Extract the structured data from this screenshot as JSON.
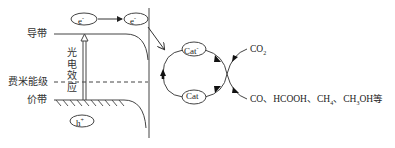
{
  "diagram": {
    "band_labels": {
      "conduction_band": "导带",
      "fermi_level": "费米能级",
      "valence_band": "价带"
    },
    "photoelectric_effect_label": [
      "光",
      "电",
      "效",
      "应"
    ],
    "carriers": {
      "electron": {
        "base": "e",
        "sup": "-"
      },
      "electron_interface": {
        "base": "e",
        "sup": "-"
      },
      "hole": {
        "base": "h",
        "sup": "+"
      }
    },
    "catalyst_cycle": {
      "reduced": {
        "base": "Cat",
        "sup": "-"
      },
      "neutral": {
        "base": "Cat",
        "sup": ""
      }
    },
    "reactant": {
      "parts": [
        {
          "t": "CO"
        },
        {
          "sub": "2"
        }
      ]
    },
    "products": {
      "text_parts": [
        {
          "t": "CO、HCOOH、CH"
        },
        {
          "sub": "4"
        },
        {
          "t": "、CH"
        },
        {
          "sub": "3"
        },
        {
          "t": "OH等"
        }
      ]
    },
    "colors": {
      "line": "#333333",
      "arrow_fill": "#111111",
      "background": "#ffffff"
    }
  }
}
